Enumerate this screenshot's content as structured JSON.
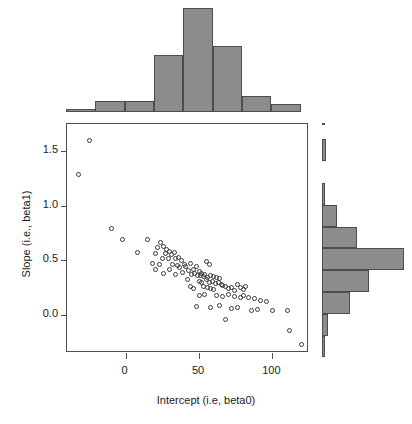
{
  "chart_data": {
    "type": "scatter",
    "title": "",
    "xlabel": "Intercept (i.e, beta0)",
    "ylabel": "Slope (i.e., beta1)",
    "xlim": [
      -40,
      125
    ],
    "ylim": [
      -0.35,
      1.75
    ],
    "xticks": [
      0,
      50,
      100
    ],
    "xticklabels": [
      "0",
      "50",
      "100"
    ],
    "yticks": [
      0.0,
      0.5,
      1.0,
      1.5
    ],
    "yticklabels": [
      "0.0",
      "0.5",
      "1.0",
      "1.5"
    ],
    "grid": false,
    "legend": null,
    "marker": "open-circle",
    "marker_color": "#3a3a3a",
    "fill_color": "#8c8c8c",
    "n_points": 100,
    "points": [
      [
        -25.0,
        1.6
      ],
      [
        -32.0,
        1.29
      ],
      [
        -10.0,
        0.79
      ],
      [
        -2.0,
        0.69
      ],
      [
        15.0,
        0.69
      ],
      [
        22.0,
        0.62
      ],
      [
        24.0,
        0.66
      ],
      [
        26.0,
        0.63
      ],
      [
        28.0,
        0.6
      ],
      [
        8.0,
        0.57
      ],
      [
        20.0,
        0.56
      ],
      [
        27.0,
        0.56
      ],
      [
        30.0,
        0.58
      ],
      [
        31.0,
        0.55
      ],
      [
        33.0,
        0.57
      ],
      [
        25.0,
        0.52
      ],
      [
        29.0,
        0.52
      ],
      [
        34.0,
        0.52
      ],
      [
        36.0,
        0.53
      ],
      [
        38.0,
        0.5
      ],
      [
        18.0,
        0.47
      ],
      [
        23.0,
        0.46
      ],
      [
        32.0,
        0.46
      ],
      [
        35.0,
        0.45
      ],
      [
        40.0,
        0.46
      ],
      [
        44.0,
        0.47
      ],
      [
        55.0,
        0.49
      ],
      [
        57.0,
        0.46
      ],
      [
        20.0,
        0.42
      ],
      [
        30.0,
        0.42
      ],
      [
        37.0,
        0.43
      ],
      [
        41.0,
        0.44
      ],
      [
        43.0,
        0.41
      ],
      [
        46.0,
        0.42
      ],
      [
        48.0,
        0.44
      ],
      [
        50.0,
        0.4
      ],
      [
        26.0,
        0.38
      ],
      [
        34.0,
        0.37
      ],
      [
        39.0,
        0.39
      ],
      [
        45.0,
        0.37
      ],
      [
        47.0,
        0.38
      ],
      [
        49.0,
        0.36
      ],
      [
        51.0,
        0.36
      ],
      [
        52.0,
        0.38
      ],
      [
        53.0,
        0.35
      ],
      [
        54.0,
        0.37
      ],
      [
        56.0,
        0.34
      ],
      [
        58.0,
        0.36
      ],
      [
        60.0,
        0.35
      ],
      [
        62.0,
        0.34
      ],
      [
        64.0,
        0.33
      ],
      [
        42.0,
        0.32
      ],
      [
        50.0,
        0.31
      ],
      [
        52.0,
        0.3
      ],
      [
        55.0,
        0.32
      ],
      [
        57.0,
        0.3
      ],
      [
        59.0,
        0.31
      ],
      [
        61.0,
        0.29
      ],
      [
        63.0,
        0.3
      ],
      [
        65.0,
        0.28
      ],
      [
        44.0,
        0.26
      ],
      [
        46.0,
        0.24
      ],
      [
        53.0,
        0.26
      ],
      [
        56.0,
        0.25
      ],
      [
        58.0,
        0.24
      ],
      [
        60.0,
        0.23
      ],
      [
        66.0,
        0.27
      ],
      [
        68.0,
        0.26
      ],
      [
        70.0,
        0.24
      ],
      [
        72.0,
        0.25
      ],
      [
        74.0,
        0.22
      ],
      [
        76.0,
        0.28
      ],
      [
        78.0,
        0.25
      ],
      [
        80.0,
        0.23
      ],
      [
        82.0,
        0.26
      ],
      [
        50.0,
        0.18
      ],
      [
        54.0,
        0.19
      ],
      [
        62.0,
        0.18
      ],
      [
        66.0,
        0.17
      ],
      [
        70.0,
        0.19
      ],
      [
        74.0,
        0.17
      ],
      [
        78.0,
        0.16
      ],
      [
        80.0,
        0.18
      ],
      [
        84.0,
        0.16
      ],
      [
        88.0,
        0.15
      ],
      [
        92.0,
        0.13
      ],
      [
        96.0,
        0.12
      ],
      [
        48.0,
        0.08
      ],
      [
        58.0,
        0.07
      ],
      [
        64.0,
        0.09
      ],
      [
        72.0,
        0.06
      ],
      [
        76.0,
        0.07
      ],
      [
        86.0,
        0.04
      ],
      [
        90.0,
        0.05
      ],
      [
        100.0,
        0.04
      ],
      [
        110.0,
        0.04
      ],
      [
        68.0,
        -0.04
      ],
      [
        112.0,
        -0.14
      ],
      [
        120.0,
        -0.27
      ]
    ],
    "top_histogram": {
      "type": "bar",
      "orientation": "vertical",
      "variable": "Intercept (i.e, beta0)",
      "bin_edges": [
        -40,
        -20,
        0,
        20,
        40,
        60,
        80,
        100,
        120
      ],
      "counts": [
        1,
        4,
        4,
        21,
        38,
        24,
        6,
        3
      ],
      "max_count": 38
    },
    "right_histogram": {
      "type": "bar",
      "orientation": "horizontal",
      "variable": "Slope (i.e., beta1)",
      "bin_edges": [
        -0.4,
        -0.2,
        0.0,
        0.2,
        0.4,
        0.6,
        0.8,
        1.0,
        1.2,
        1.4,
        1.6
      ],
      "counts": [
        1,
        3,
        13,
        22,
        38,
        16,
        7,
        1,
        0,
        2,
        1
      ],
      "max_count": 38
    }
  },
  "axes": {
    "x_title": "Intercept (i.e, beta0)",
    "y_title": "Slope (i.e., beta1)",
    "x_tick_labels": [
      "0",
      "50",
      "100"
    ],
    "y_tick_labels": [
      "0.0",
      "0.5",
      "1.0",
      "1.5"
    ]
  },
  "style": {
    "bar_fill": "#8c8c8c",
    "bar_stroke": "#4d4d4d",
    "point_stroke": "#3a3a3a",
    "axis_color": "#4d4d4d",
    "text_color": "#1a1a1a",
    "background": "#ffffff"
  }
}
